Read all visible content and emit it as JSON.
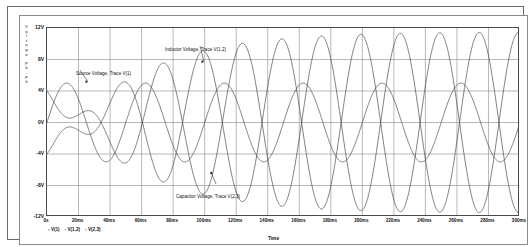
{
  "chart_data": {
    "type": "line",
    "title": "",
    "xlabel": "Time",
    "ylabel": "Voltage Pk-Pk",
    "ylabel_stacked": "V\no\nl\nt\na\ng\ne\n\nP\nk\n-\nP\nk",
    "xlim": [
      0,
      300
    ],
    "ylim": [
      -12,
      12
    ],
    "x_unit": "ms",
    "y_unit": "V",
    "grid": true,
    "legend_position": "below-axis",
    "x_ticks": [
      "0s",
      "20ms",
      "40ms",
      "60ms",
      "80ms",
      "100ms",
      "120ms",
      "140ms",
      "160ms",
      "180ms",
      "200ms",
      "220ms",
      "240ms",
      "260ms",
      "280ms",
      "300ms"
    ],
    "x_tick_values": [
      0,
      20,
      40,
      60,
      80,
      100,
      120,
      140,
      160,
      180,
      200,
      220,
      240,
      260,
      280,
      300
    ],
    "y_ticks": [
      "12V",
      "8V",
      "4V",
      "0V",
      "-4V",
      "-8V",
      "-12V"
    ],
    "y_tick_values": [
      12,
      8,
      4,
      0,
      -4,
      -8,
      -12
    ],
    "series": [
      {
        "name": "V(1)",
        "label": "Source Voltage, Trace V(1)",
        "color": "#3a3a3a",
        "amplitude": 5.0,
        "period_ms": 50,
        "phase_deg": 0,
        "steady_amplitude": 5.0,
        "description": "Source sine, 5V amplitude, 20 Hz, steady from t=0"
      },
      {
        "name": "V(1,2)",
        "label": "Inductor Voltage, Trace V(1,2)",
        "color": "#3a3a3a",
        "amplitude": 11.5,
        "period_ms": 50,
        "phase_deg": 96,
        "steady_amplitude": 11.5,
        "description": "Inductor voltage, grows from 0 to ~11.5V amplitude, leads source"
      },
      {
        "name": "V(2,3)",
        "label": "Capacitor Voltage, Trace V(2,3)",
        "color": "#3a3a3a",
        "amplitude": 11.5,
        "period_ms": 50,
        "phase_deg": -84,
        "steady_amplitude": 11.5,
        "description": "Capacitor voltage, grows from 0 to ~11.5V amplitude, lags source"
      }
    ],
    "legend_entries": [
      {
        "marker": "▫",
        "text": "V(1)"
      },
      {
        "marker": "▫",
        "text": "V(1,2)"
      },
      {
        "marker": "▫",
        "text": "V(2,3)"
      }
    ],
    "annotations": [
      {
        "name": "source",
        "text": "Source Voltage, Trace V(1)"
      },
      {
        "name": "inductor",
        "text": "Inductor Voltage, Trace V(1,2)"
      },
      {
        "name": "capacitor",
        "text": "Capacitor Voltage, Trace V(2,3)"
      }
    ],
    "colors": {
      "grid": "#9a9a9a",
      "axis": "#4a4a4a",
      "trace": "#3a3a3a",
      "background": "#ffffff",
      "border": "#6b6b6b"
    }
  }
}
